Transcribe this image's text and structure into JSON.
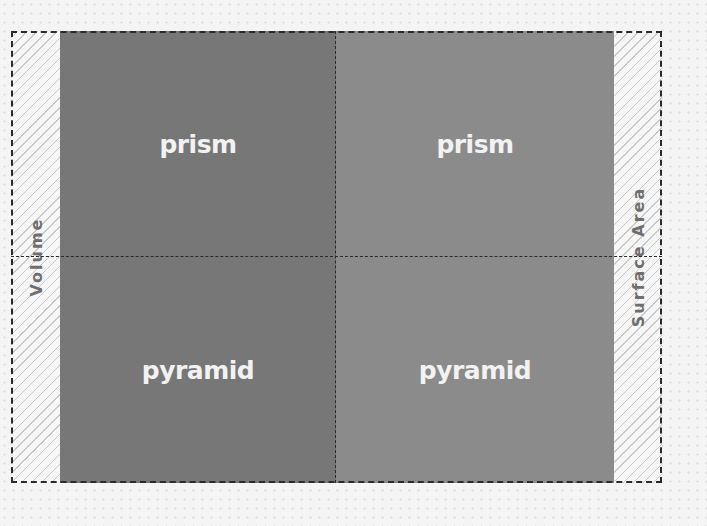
{
  "diagram": {
    "type": "2x2 grid",
    "row_axis_label": "Volume",
    "column_axis_label": "Surface Area",
    "cells": [
      {
        "row": 0,
        "col": 0,
        "label": "prism",
        "color": "#777777"
      },
      {
        "row": 0,
        "col": 1,
        "label": "prism",
        "color": "#8b8b8b"
      },
      {
        "row": 1,
        "col": 0,
        "label": "pyramid",
        "color": "#777777"
      },
      {
        "row": 1,
        "col": 1,
        "label": "pyramid",
        "color": "#8b8b8b"
      }
    ]
  },
  "colors": {
    "left_column": "#777777",
    "right_column": "#8b8b8b",
    "text": "#f2f2f2",
    "border": "#2a2a2a",
    "label_text": "#6e6e6e"
  }
}
